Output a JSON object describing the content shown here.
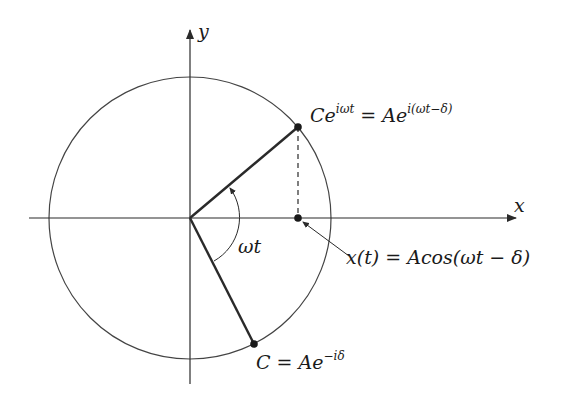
{
  "diagram": {
    "type": "phasor",
    "colors": {
      "stroke": "#2a2a2a",
      "circle": "#444444",
      "background": "#ffffff"
    },
    "axes": {
      "x_label": "x",
      "y_label": "y"
    },
    "origin": {
      "px": 190,
      "py": 218
    },
    "circle_radius_px": 141,
    "labels": {
      "rotating_phasor": {
        "base": "Ce",
        "base_exp": "iωt",
        "equals": "=",
        "rhs": "Ae",
        "rhs_exp": "i(ωt−δ)"
      },
      "projection": {
        "text": "x(t) = Acos(ωt − δ)"
      },
      "initial_phasor": {
        "base": "C = Ae",
        "exp": "−iδ"
      },
      "angle": {
        "text": "ωt"
      }
    },
    "points": {
      "rotating": {
        "px": 298,
        "py": 127
      },
      "projection": {
        "px": 298,
        "py": 218
      },
      "initial": {
        "px": 254,
        "py": 344
      }
    }
  }
}
